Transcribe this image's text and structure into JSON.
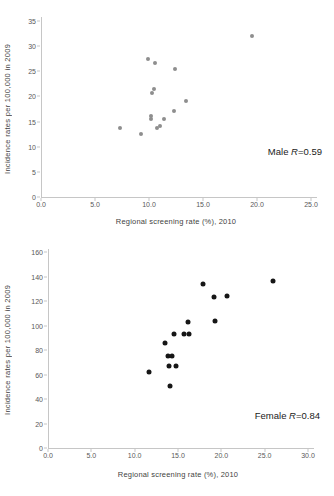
{
  "colors": {
    "background": "#ffffff",
    "axis_line": "#c6c6c6",
    "tick_label": "#595959",
    "axis_title": "#3f3f3f",
    "annotation": "#1a1a1a",
    "male_dot": "#8e8e8e",
    "female_dot": "#161616"
  },
  "chart_data": [
    {
      "id": "male",
      "type": "scatter",
      "title": "",
      "xlabel": "Regional screening rate (%), 2010",
      "ylabel": "Incidence rates per 100,000 in 2009",
      "annotation": {
        "group": "Male",
        "symbol": "R",
        "value": "=0.59"
      },
      "xlim": [
        0,
        25
      ],
      "ylim": [
        0,
        35
      ],
      "xticks": [
        "0.0",
        "5.0",
        "10.0",
        "15.0",
        "20.0",
        "25.0"
      ],
      "yticks": [
        "0",
        "5",
        "10",
        "15",
        "20",
        "25",
        "30",
        "35"
      ],
      "grid": false,
      "legend": "none",
      "dot_color": "#8e8e8e",
      "dot_size": 4,
      "points": [
        [
          7.3,
          13.7
        ],
        [
          9.3,
          12.5
        ],
        [
          9.9,
          27.5
        ],
        [
          10.2,
          16.1
        ],
        [
          10.2,
          15.5
        ],
        [
          10.3,
          20.6
        ],
        [
          10.5,
          21.5
        ],
        [
          10.6,
          26.6
        ],
        [
          10.7,
          13.8
        ],
        [
          11.0,
          14.2
        ],
        [
          11.4,
          15.5
        ],
        [
          12.3,
          17.1
        ],
        [
          12.4,
          25.5
        ],
        [
          13.4,
          19.0
        ],
        [
          19.5,
          32.0
        ]
      ]
    },
    {
      "id": "female",
      "type": "scatter",
      "title": "",
      "xlabel": "Regional screening rate (%), 2010",
      "ylabel": "Incidence rates per 100,000 in 2009",
      "annotation": {
        "group": "Female",
        "symbol": "R",
        "value": "=0.84"
      },
      "xlim": [
        0,
        30
      ],
      "ylim": [
        0,
        160
      ],
      "xticks": [
        "0.0",
        "5.0",
        "10.0",
        "15.0",
        "20.0",
        "25.0",
        "30.0"
      ],
      "yticks": [
        "0",
        "20",
        "40",
        "60",
        "80",
        "100",
        "120",
        "140",
        "160"
      ],
      "grid": false,
      "legend": "none",
      "dot_color": "#161616",
      "dot_size": 5,
      "points": [
        [
          11.7,
          62
        ],
        [
          13.5,
          86
        ],
        [
          13.8,
          75
        ],
        [
          14.0,
          67
        ],
        [
          14.1,
          51
        ],
        [
          14.3,
          75
        ],
        [
          14.5,
          93
        ],
        [
          14.8,
          67
        ],
        [
          15.7,
          93
        ],
        [
          16.2,
          103
        ],
        [
          16.3,
          93
        ],
        [
          17.9,
          134
        ],
        [
          19.2,
          123
        ],
        [
          19.3,
          104
        ],
        [
          20.7,
          124
        ],
        [
          26.0,
          136
        ]
      ]
    }
  ]
}
